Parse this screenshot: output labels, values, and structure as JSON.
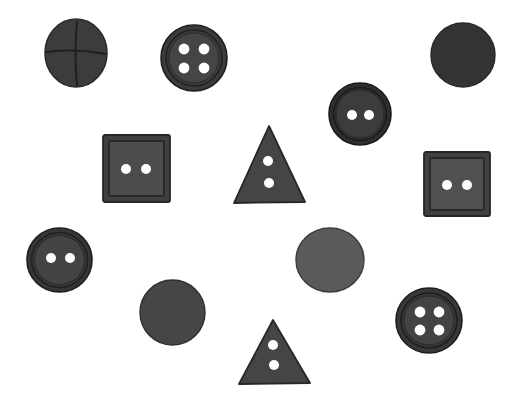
{
  "scene": {
    "width": 516,
    "height": 417,
    "background_color": "#ffffff",
    "description": "Scattered dark sewing buttons of various shapes on a white background"
  },
  "palette": {
    "very_dark": "#2f2f2f",
    "dark": "#353535",
    "dark_body": "#3a3a3a",
    "mid_dark": "#414141",
    "mid": "#4a4a4a",
    "mid_gray": "#575757",
    "light_gray": "#5c5c5c",
    "hole": "#ffffff",
    "rim_line": "#262626",
    "outline": "#232323",
    "background": "#ffffff"
  },
  "objects": [
    {
      "id": "button-cross-slit",
      "name": "round-button-cross-slit",
      "type": "circle",
      "x": 44,
      "y": 18,
      "w": 64,
      "h": 70,
      "fill": "#3c3c3c",
      "edge": "#2a2a2a",
      "holes": 0,
      "hole_pattern": "cross-slit",
      "label": "Round button with cross-shaped slit"
    },
    {
      "id": "button-4hole-top",
      "name": "round-button-4-hole-top",
      "type": "circle-rimmed",
      "x": 160,
      "y": 24,
      "w": 68,
      "h": 68,
      "fill": "#3e3e3e",
      "edge": "#262626",
      "rim": 7,
      "holes": 4,
      "hole_pattern": "square-4",
      "hole_r": 5.5,
      "label": "Round rimmed button with four holes"
    },
    {
      "id": "disc-dark-topright",
      "name": "plain-disc-top-right",
      "type": "circle",
      "x": 430,
      "y": 22,
      "w": 66,
      "h": 66,
      "fill": "#333333",
      "edge": "#262626",
      "holes": 0,
      "hole_pattern": "none",
      "label": "Plain dark disc"
    },
    {
      "id": "button-2hole-upperright",
      "name": "round-button-2-hole-upper-right",
      "type": "circle-rimmed",
      "x": 328,
      "y": 82,
      "w": 64,
      "h": 64,
      "fill": "#393939",
      "edge": "#202020",
      "rim": 7,
      "holes": 2,
      "hole_pattern": "horizontal-2",
      "hole_r": 5,
      "label": "Round rimmed button with two holes"
    },
    {
      "id": "square-2hole-left",
      "name": "square-button-2-hole-left",
      "type": "square-framed",
      "x": 102,
      "y": 134,
      "w": 69,
      "h": 69,
      "fill": "#484848",
      "edge": "#2c2c2c",
      "rim": 8,
      "holes": 2,
      "hole_pattern": "horizontal-2",
      "hole_r": 5,
      "label": "Square framed button with two holes"
    },
    {
      "id": "triangle-2hole-top",
      "name": "triangle-button-2-hole-top",
      "type": "triangle",
      "x": 232,
      "y": 124,
      "w": 74,
      "h": 80,
      "fill": "#454545",
      "edge": "#2a2a2a",
      "holes": 2,
      "hole_pattern": "vertical-2",
      "hole_r": 5,
      "label": "Triangular button with two holes"
    },
    {
      "id": "square-2hole-right",
      "name": "square-button-2-hole-right",
      "type": "square-framed",
      "x": 423,
      "y": 151,
      "w": 68,
      "h": 66,
      "fill": "#4d4d4d",
      "edge": "#2c2c2c",
      "rim": 8,
      "holes": 2,
      "hole_pattern": "horizontal-2",
      "hole_r": 5,
      "label": "Square framed button with two holes"
    },
    {
      "id": "button-2hole-left",
      "name": "round-button-2-hole-left",
      "type": "circle-rimmed",
      "x": 26,
      "y": 227,
      "w": 67,
      "h": 66,
      "fill": "#434343",
      "edge": "#242424",
      "rim": 7,
      "holes": 2,
      "hole_pattern": "horizontal-2",
      "hole_r": 5,
      "label": "Round rimmed button with two holes"
    },
    {
      "id": "disc-gray-center",
      "name": "plain-disc-center",
      "type": "circle",
      "x": 295,
      "y": 227,
      "w": 70,
      "h": 66,
      "fill": "#5a5a5a",
      "edge": "#3d3d3d",
      "holes": 0,
      "hole_pattern": "none",
      "label": "Plain gray disc"
    },
    {
      "id": "disc-dark-lowerleft",
      "name": "plain-disc-lower-left",
      "type": "circle",
      "x": 139,
      "y": 279,
      "w": 67,
      "h": 67,
      "fill": "#464646",
      "edge": "#2e2e2e",
      "holes": 0,
      "hole_pattern": "none",
      "label": "Plain dark disc"
    },
    {
      "id": "triangle-2hole-bottom",
      "name": "triangle-button-2-hole-bottom",
      "type": "triangle",
      "x": 237,
      "y": 318,
      "w": 74,
      "h": 67,
      "fill": "#454545",
      "edge": "#2a2a2a",
      "holes": 2,
      "hole_pattern": "vertical-2",
      "hole_r": 5,
      "label": "Triangular button with two holes"
    },
    {
      "id": "button-4hole-lowerright",
      "name": "round-button-4-hole-lower-right",
      "type": "circle-rimmed",
      "x": 395,
      "y": 287,
      "w": 68,
      "h": 67,
      "fill": "#3e3e3e",
      "edge": "#232323",
      "rim": 8,
      "holes": 4,
      "hole_pattern": "square-4",
      "hole_r": 5.5,
      "label": "Round rimmed button with four holes"
    }
  ],
  "summary": {
    "total_objects": 12,
    "circles": 7,
    "squares": 2,
    "triangles": 2
  }
}
